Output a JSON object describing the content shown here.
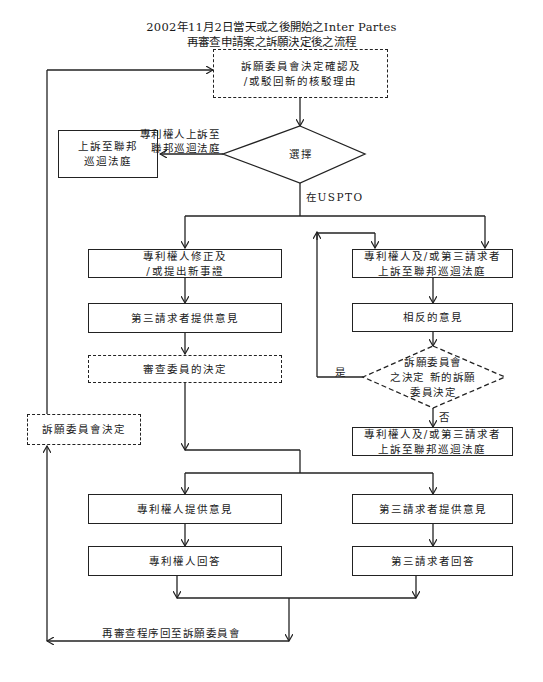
{
  "title": {
    "line1": "2002年11月2日當天或之後開始之Inter Partes",
    "line2": "再審查申請案之訴願決定後之流程"
  },
  "nodes": {
    "board_decision_confirm": {
      "text": "訴願委員會決定確認及\n/或駁回新的核駁理由",
      "style": "dashed"
    },
    "choice": {
      "text": "選擇",
      "shape": "diamond"
    },
    "appeal_federal_circuit": {
      "text": "上訴至聯邦\n巡迴法庭",
      "style": "solid"
    },
    "patentee_amend": {
      "text": "專利權人修正及\n/或提出新事證",
      "style": "solid"
    },
    "third_party_comments": {
      "text": "第三請求者提供意見",
      "style": "solid"
    },
    "examiner_decision": {
      "text": "審查委員的決定",
      "style": "dashed"
    },
    "board_decision": {
      "text": "訴願委員會決定",
      "style": "dashed"
    },
    "appeal_both_1": {
      "text": "專利權人及/或第三請求者\n上訴至聯邦巡迴法庭",
      "style": "solid"
    },
    "opposing_comments": {
      "text": "相反的意見",
      "style": "solid"
    },
    "new_board_decision": {
      "text": "訴願委員會\n之決定 新的訴願\n委員決定",
      "shape": "diamond",
      "style": "dashed"
    },
    "appeal_both_2": {
      "text": "專利權人及/或第三請求者\n上訴至聯邦巡迴法庭",
      "style": "solid"
    },
    "patentee_comments": {
      "text": "專利權人提供意見",
      "style": "solid"
    },
    "patentee_reply": {
      "text": "專利權人回答",
      "style": "solid"
    },
    "third_party_comments_2": {
      "text": "第三請求者提供意見",
      "style": "solid"
    },
    "third_party_reply": {
      "text": "第三請求者回答",
      "style": "solid"
    }
  },
  "edge_labels": {
    "patentee_appeal": "專利權人上訴至\n聯邦巡迴法庭",
    "at_uspto": "在USPTO",
    "yes": "是",
    "no": "否",
    "return_to_board": "再審查程序回至訴願委員會"
  },
  "colors": {
    "line": "#222222",
    "background": "#ffffff"
  }
}
